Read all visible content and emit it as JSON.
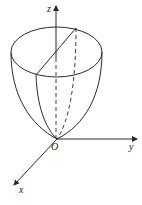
{
  "figure": {
    "colors": {
      "stroke": "#2a2a2a",
      "background": "#ffffff"
    },
    "labels": {
      "z_axis": "z",
      "y_axis": "y",
      "x_axis": "x",
      "origin": "O"
    }
  }
}
